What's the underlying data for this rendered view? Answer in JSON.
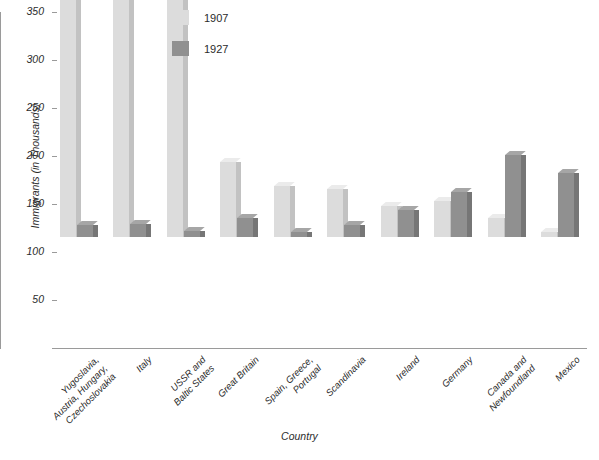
{
  "chart_data": {
    "type": "bar",
    "title": "",
    "xlabel": "Country",
    "ylabel": "Immigrants (in Thousands)",
    "ylim": [
      0,
      350
    ],
    "yticks": [
      50,
      100,
      150,
      200,
      250,
      300,
      350
    ],
    "ytick_labels": [
      "50",
      "100",
      "150",
      "200",
      "250",
      "300",
      "350"
    ],
    "grid": false,
    "legend_position": "top-center",
    "categories": [
      "Yugoslavia,\nAustria, Hungary,\nCzechoslovakia",
      "Italy",
      "USSR and\nBaltic States",
      "Great Britain",
      "Spain, Greece,\nPortugal",
      "Scandinavia",
      "Ireland",
      "Germany",
      "Canada and\nNewfoundland",
      "Mexico"
    ],
    "series": [
      {
        "name": "1907",
        "color": "#dcdcdc",
        "values": [
          337,
          285,
          259,
          78,
          53,
          50,
          32,
          37,
          20,
          5
        ]
      },
      {
        "name": "1927",
        "color": "#909090",
        "values": [
          12,
          14,
          6,
          20,
          5,
          13,
          28,
          47,
          85,
          67
        ]
      }
    ]
  },
  "legend": {
    "items": [
      {
        "label": "1907",
        "color": "#dcdcdc"
      },
      {
        "label": "1927",
        "color": "#909090"
      }
    ]
  },
  "axes": {
    "y_title": "Immigrants (in Thousands)",
    "x_title": "Country"
  }
}
